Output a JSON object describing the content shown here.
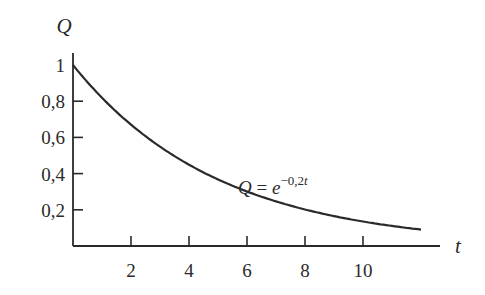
{
  "chart_data": {
    "type": "line",
    "title": "",
    "xlabel": "t",
    "ylabel": "Q",
    "annotation": "Q = e^{-0,2t}",
    "formula_text": {
      "lhs": "Q = e",
      "exponent": "−0,2t"
    },
    "function": "Q = exp(-0.2 t)",
    "x_ticks": [
      2,
      4,
      6,
      8,
      10
    ],
    "x_tick_labels": [
      "2",
      "4",
      "6",
      "8",
      "10"
    ],
    "y_ticks": [
      0.2,
      0.4,
      0.6,
      0.8,
      1
    ],
    "y_tick_labels": [
      "0,2",
      "0,4",
      "0,6",
      "0,8",
      "1"
    ],
    "xlim": [
      0,
      13
    ],
    "ylim": [
      0,
      1.1
    ],
    "grid": false,
    "legend": "none",
    "series": [
      {
        "name": "Q = e^{-0,2t}",
        "x": [
          0,
          1,
          2,
          3,
          4,
          5,
          6,
          7,
          8,
          9,
          10,
          11,
          12
        ],
        "values": [
          1.0,
          0.819,
          0.67,
          0.549,
          0.449,
          0.368,
          0.301,
          0.247,
          0.202,
          0.165,
          0.135,
          0.111,
          0.091
        ]
      }
    ],
    "colors": {
      "line": "#2a2a2a",
      "axis": "#2a2a2a",
      "background": "#ffffff"
    }
  }
}
